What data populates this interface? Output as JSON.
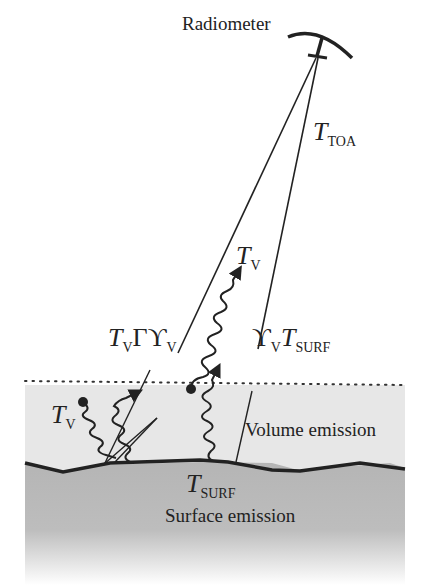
{
  "labels": {
    "radiometer": "Radiometer",
    "t_toa": {
      "main": "T",
      "sub": "TOA"
    },
    "t_v_top": {
      "main": "T",
      "sub": "V"
    },
    "t_gamma_upsilon": {
      "T": "T",
      "T_sub": "V",
      "gamma": "Γ",
      "upsilon": "ϒ",
      "upsilon_sub": "V"
    },
    "upsilon_tsurf": {
      "upsilon": "ϒ",
      "upsilon_sub": "V",
      "T": "T",
      "T_sub": "SURF"
    },
    "t_v_left": {
      "main": "T",
      "sub": "V"
    },
    "volume_emission": "Volume emission",
    "t_surf": {
      "main": "T",
      "sub": "SURF"
    },
    "surface_emission": "Surface emission"
  },
  "colors": {
    "ink": "#222222",
    "volume_layer": "#e6e6e6",
    "surface_layer": "#b8b8b8"
  }
}
